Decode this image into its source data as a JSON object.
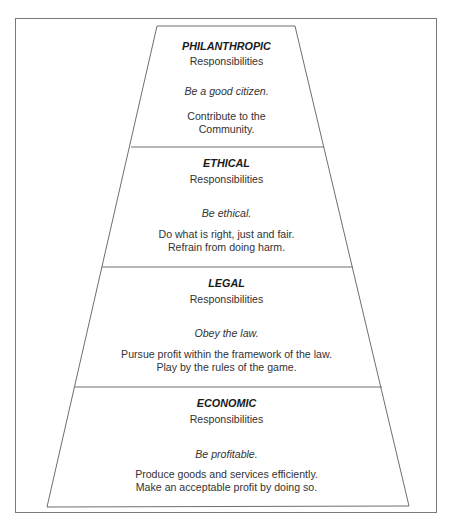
{
  "diagram": {
    "type": "pyramid",
    "line_color": "#6e6e6e",
    "text_color": "#262626",
    "tiers": [
      {
        "name": "PHILANTHROPIC",
        "subtitle": "Responsibilities",
        "motto": "Be a good citizen.",
        "description": [
          "Contribute to the",
          "Community."
        ]
      },
      {
        "name": "ETHICAL",
        "subtitle": "Responsibilities",
        "motto": "Be ethical.",
        "description": [
          "Do what is right, just and fair.",
          "Refrain from doing harm."
        ]
      },
      {
        "name": "LEGAL",
        "subtitle": "Responsibilities",
        "motto": "Obey the law.",
        "description": [
          "Pursue profit within the framework of the law.",
          "Play by the rules of the game."
        ]
      },
      {
        "name": "ECONOMIC",
        "subtitle": "Responsibilities",
        "motto": "Be profitable.",
        "description": [
          "Produce goods and services efficiently.",
          "Make an acceptable profit by doing so."
        ]
      }
    ]
  }
}
